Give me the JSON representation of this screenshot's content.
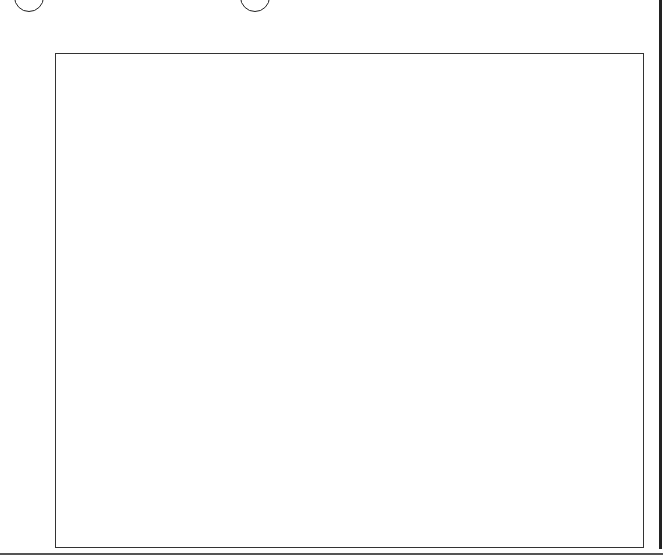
{
  "grid": {
    "columns": 11,
    "rows": 9,
    "row_labels": [
      "2",
      "4",
      "6",
      "8",
      "10",
      "12",
      "14",
      "16",
      "18"
    ],
    "shaded_cells": [
      [
        1,
        2,
        4
      ],
      [
        6,
        7,
        8,
        10
      ],
      [
        1,
        2,
        4,
        6
      ],
      [
        1,
        2,
        8,
        10
      ],
      [
        4,
        6,
        8,
        10
      ],
      [
        1,
        3,
        4,
        6,
        8,
        9
      ],
      [
        1,
        3
      ],
      [
        1,
        3,
        4,
        5,
        6,
        7,
        8,
        9
      ],
      [
        9
      ]
    ],
    "shade_color": "#e6e6e6",
    "line_color": "#333333"
  },
  "filled_numbers": [
    {
      "value": "21",
      "row": 0,
      "col": 3
    },
    {
      "value": "26",
      "row": 0,
      "col": 5
    },
    {
      "value": "52",
      "row": 2,
      "col": 7
    },
    {
      "value": "92",
      "row": 5,
      "col": 10
    },
    {
      "value": "34",
      "row": 6,
      "col": 4
    }
  ],
  "callouts": [
    {
      "id": "1",
      "points_to": "row 0 col 0 (2)",
      "direction": "down"
    },
    {
      "id": "2",
      "points_to": "21",
      "direction": "down"
    },
    {
      "id": "3",
      "points_to": "26",
      "direction": "down"
    },
    {
      "id": "4",
      "points_to": "26",
      "direction": "right"
    },
    {
      "id": "5",
      "points_to": "row 0 col 9",
      "direction": "down"
    },
    {
      "id": "6",
      "points_to": "4",
      "direction": "right"
    },
    {
      "id": "7",
      "points_to": "52",
      "direction": "down"
    },
    {
      "id": "8",
      "points_to": "52",
      "direction": "right"
    },
    {
      "id": "9",
      "points_to": "row 3 col 3",
      "direction": "right"
    },
    {
      "id": "10",
      "points_to": "10",
      "direction": "right"
    },
    {
      "id": "11",
      "points_to": "row 4 col 2",
      "direction": "down"
    },
    {
      "id": "12",
      "points_to": "92",
      "direction": "down"
    },
    {
      "id": "13",
      "points_to": "34",
      "direction": "right"
    },
    {
      "id": "14",
      "points_to": "18",
      "direction": "right"
    }
  ]
}
